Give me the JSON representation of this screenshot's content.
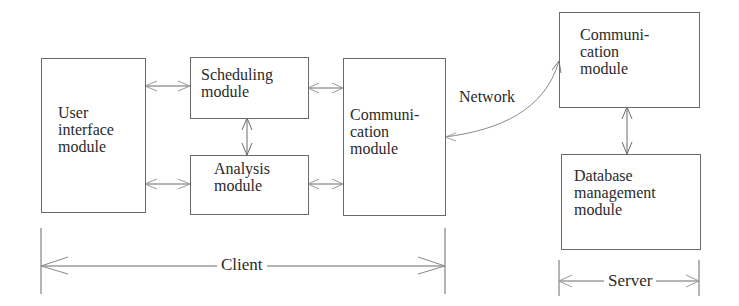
{
  "diagram": {
    "client": {
      "label": "Client",
      "modules": {
        "user_interface": {
          "line1": "User",
          "line2": "interface",
          "line3": "module"
        },
        "scheduling": {
          "line1": "Scheduling",
          "line2": "module"
        },
        "analysis": {
          "line1": "Analysis",
          "line2": "module"
        },
        "communication": {
          "line1": "Communi-",
          "line2": "cation",
          "line3": "module"
        }
      }
    },
    "network": {
      "label": "Network"
    },
    "server": {
      "label": "Server",
      "modules": {
        "communication": {
          "line1": "Communi-",
          "line2": "cation",
          "line3": "module"
        },
        "database": {
          "line1": "Database",
          "line2": "management",
          "line3": "module"
        }
      }
    },
    "connections": [
      {
        "from": "User interface module",
        "to": "Scheduling module",
        "type": "bidirectional"
      },
      {
        "from": "User interface module",
        "to": "Analysis module",
        "type": "bidirectional"
      },
      {
        "from": "Scheduling module",
        "to": "Analysis module",
        "type": "bidirectional"
      },
      {
        "from": "Scheduling module",
        "to": "Client Communication module",
        "type": "bidirectional"
      },
      {
        "from": "Analysis module",
        "to": "Client Communication module",
        "type": "bidirectional"
      },
      {
        "from": "Client Communication module",
        "to": "Server Communication module",
        "type": "bidirectional",
        "label": "Network"
      },
      {
        "from": "Server Communication module",
        "to": "Database management module",
        "type": "bidirectional"
      }
    ]
  }
}
